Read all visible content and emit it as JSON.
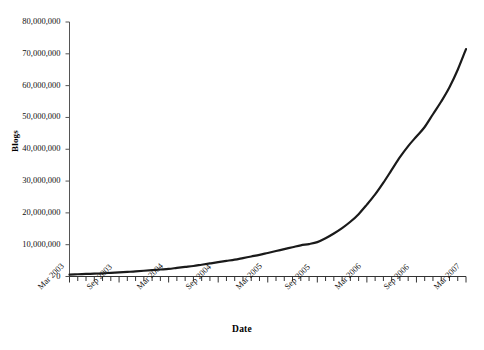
{
  "chart_data": {
    "type": "line",
    "title": "",
    "xlabel": "Date",
    "ylabel": "Blogs",
    "grid": false,
    "legend": "none",
    "ylim": [
      0,
      80000000
    ],
    "yticks": [
      0,
      10000000,
      20000000,
      30000000,
      40000000,
      50000000,
      60000000,
      70000000,
      80000000
    ],
    "ytick_labels": [
      "0",
      "10,000,000",
      "20,000,000",
      "30,000,000",
      "40,000,000",
      "50,000,000",
      "60,000,000",
      "70,000,000",
      "80,000,000"
    ],
    "xtick_labels": [
      "Mar 2003",
      "Sep 2003",
      "Mar 2004",
      "Sep 2004",
      "Mar 2005",
      "Sep 2005",
      "Mar 2006",
      "Sep 2006",
      "Mar 2007"
    ],
    "minor_tick_interval": "1 month",
    "x": [
      "Mar 2003",
      "Apr 2003",
      "May 2003",
      "Jun 2003",
      "Jul 2003",
      "Aug 2003",
      "Sep 2003",
      "Oct 2003",
      "Nov 2003",
      "Dec 2003",
      "Jan 2004",
      "Feb 2004",
      "Mar 2004",
      "Apr 2004",
      "May 2004",
      "Jun 2004",
      "Jul 2004",
      "Aug 2004",
      "Sep 2004",
      "Oct 2004",
      "Nov 2004",
      "Dec 2004",
      "Jan 2005",
      "Feb 2005",
      "Mar 2005",
      "Apr 2005",
      "May 2005",
      "Jun 2005",
      "Jul 2005",
      "Aug 2005",
      "Sep 2005",
      "Oct 2005",
      "Nov 2005",
      "Dec 2005",
      "Jan 2006",
      "Feb 2006",
      "Mar 2006",
      "Apr 2006",
      "May 2006",
      "Jun 2006",
      "Jul 2006",
      "Aug 2006",
      "Sep 2006",
      "Oct 2006",
      "Nov 2006",
      "Dec 2006",
      "Jan 2007",
      "Feb 2007",
      "Mar 2007"
    ],
    "values": [
      600000,
      700000,
      800000,
      900000,
      1000000,
      1150000,
      1300000,
      1450000,
      1600000,
      1800000,
      2000000,
      2200000,
      2400000,
      2700000,
      3000000,
      3300000,
      3700000,
      4100000,
      4500000,
      4900000,
      5300000,
      5800000,
      6300000,
      6800000,
      7400000,
      8000000,
      8600000,
      9200000,
      9800000,
      10200000,
      10800000,
      12000000,
      13500000,
      15200000,
      17200000,
      19600000,
      22600000,
      25800000,
      29500000,
      33500000,
      37500000,
      41000000,
      44000000,
      47000000,
      51000000,
      55000000,
      59500000,
      65000000,
      71500000
    ],
    "line_color": "#1a1a1a",
    "line_width": 2.2
  },
  "axes": {
    "y_title": "Blogs",
    "x_title": "Date"
  }
}
